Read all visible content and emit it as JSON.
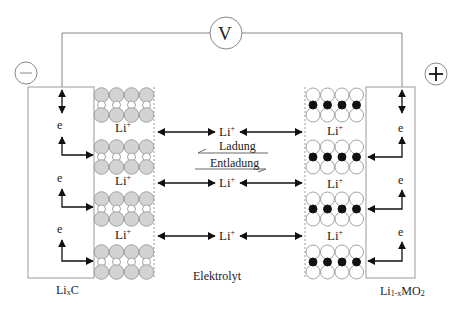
{
  "voltmeter": {
    "label": "V"
  },
  "terminals": {
    "negative": "−",
    "positive": "+"
  },
  "electron_label": "e",
  "ion_label": {
    "base": "Li",
    "charge": "+"
  },
  "center": {
    "charge_label": "Ladung",
    "discharge_label": "Entladung",
    "electrolyte_label": "Elektrolyt"
  },
  "anode": {
    "label_base": "Li",
    "label_sub": "x",
    "label_tail": "C"
  },
  "cathode": {
    "label_base": "Li",
    "label_sub": "1-x",
    "label_tail": "MO",
    "label_sub2": "2"
  },
  "colors": {
    "line": "#888888",
    "arrow": "#111111",
    "graphite": "#d3d3d3",
    "ion_dark": "#111111",
    "oxygen": "#ffffff"
  }
}
